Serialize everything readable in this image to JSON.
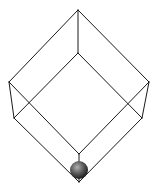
{
  "diagram": {
    "type": "wireframe-cube-with-ball",
    "colors": {
      "background": "#ffffff",
      "edge": "#1a1a1a",
      "ball_highlight": "#b0b0b0",
      "ball_mid": "#5a5a5a",
      "ball_shadow": "#1e1e1e"
    },
    "vertices": {
      "top": [
        78,
        10
      ],
      "left_upper": [
        9,
        82
      ],
      "right_upper": [
        149,
        82
      ],
      "center_upper": [
        78,
        53
      ],
      "left_lower": [
        14,
        118
      ],
      "right_lower": [
        142,
        118
      ],
      "center_lower": [
        79,
        154
      ],
      "bottom": [
        79,
        182
      ]
    },
    "ball": {
      "cx": 79,
      "cy": 170,
      "r": 9
    }
  }
}
